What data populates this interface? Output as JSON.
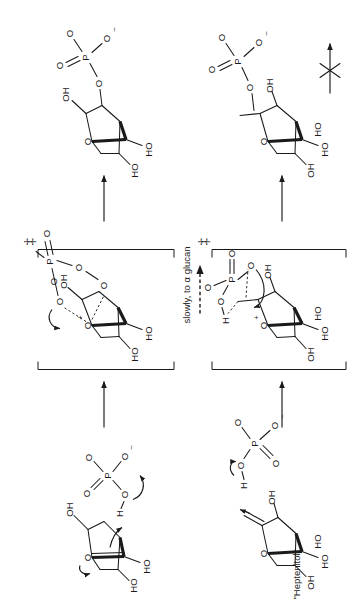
{
  "figure": {
    "kind": "reaction-mechanism-scheme",
    "orientation_note": "rotated",
    "background_color": "#ffffff",
    "ink_color": "#1a1a1a"
  },
  "labels": {
    "conditions_slow": "slowly, to α glucan",
    "heptenitol": "\"Heptenitol\"",
    "dagger": "‡"
  },
  "atoms": {
    "O": "O",
    "OH": "OH",
    "HO": "HO",
    "P": "P",
    "H": "H",
    "minus": "–",
    "plus": "+"
  },
  "row_top": {
    "name": "glucal-pathway",
    "reactant": {
      "name": "glucal-plus-phosphate",
      "ring_O": "O",
      "substituents": [
        "OH",
        "HO",
        "HO"
      ],
      "phosphate": {
        "P": "P",
        "O_double": "O",
        "O_single": [
          "O",
          "O"
        ],
        "OH": "O",
        "charge": "–"
      }
    },
    "transition_state": {
      "name": "glucal-transition-state",
      "dagger": "‡",
      "ring_O_charge": "+",
      "substituents": [
        "OH",
        "HO",
        "HO"
      ],
      "phosphate": {
        "P": "P",
        "O_double": "O",
        "O": "O",
        "OH": "O"
      }
    },
    "product": {
      "name": "glucose-1-phosphate",
      "ring_O": "O",
      "substituents": [
        "OH",
        "HO",
        "HO",
        "O"
      ],
      "phosphate": {
        "P": "P",
        "O_double": "O",
        "O_single": [
          "O",
          "O"
        ],
        "charge": "–"
      }
    },
    "arrow_out_label": "slowly, to α glucan"
  },
  "row_bottom": {
    "name": "heptenitol-pathway",
    "reactant": {
      "name": "heptenitol-plus-phosphate",
      "label": "\"Heptenitol\"",
      "ring_O": "O",
      "substituents": [
        "OH",
        "OH",
        "HO",
        "HO"
      ],
      "phosphate": {
        "P": "P",
        "H": "H",
        "O_double": [
          "O",
          "O"
        ],
        "O_single": [
          "O",
          "O"
        ],
        "charge": "–"
      }
    },
    "transition_state": {
      "name": "heptenitol-transition-state",
      "dagger": "‡",
      "ring_O_charge": "+",
      "substituents": [
        "OH",
        "OH",
        "HO",
        "HO"
      ],
      "phosphate": {
        "P": "P",
        "H": "H",
        "O_double": "O",
        "O": "O"
      }
    },
    "product": {
      "name": "heptenitol-phosphate-product",
      "ring_O": "O",
      "substituents": [
        "OH",
        "OH",
        "HO",
        "HO"
      ],
      "methyl": "CH3",
      "phosphate": {
        "P": "P",
        "O_double": "O",
        "O_single": [
          "O",
          "O"
        ],
        "charge": "–"
      }
    },
    "no_reaction_arrow": {
      "name": "crossed-arrow",
      "meaning": "no-reaction"
    }
  }
}
